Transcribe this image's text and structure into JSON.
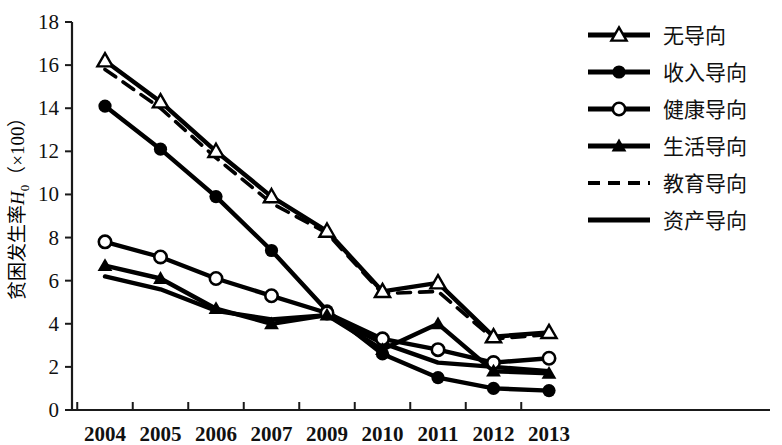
{
  "chart_data": {
    "type": "line",
    "title": "",
    "xlabel": "",
    "ylabel": "贫困发生率H0（×100）",
    "ylabel_parts": {
      "prefix": "贫困发生率",
      "italic": "H",
      "subscript": "0",
      "suffix": "（×100）"
    },
    "categories": [
      "2004",
      "2005",
      "2006",
      "2007",
      "2009",
      "2010",
      "2011",
      "2012",
      "2013"
    ],
    "x": [
      2004,
      2005,
      2006,
      2007,
      2009,
      2010,
      2011,
      2012,
      2013
    ],
    "ylim": [
      0,
      18
    ],
    "yticks": [
      0,
      2,
      4,
      6,
      8,
      10,
      12,
      14,
      16,
      18
    ],
    "grid": false,
    "legend_position": "top-right",
    "series": [
      {
        "name": "无导向",
        "marker": "triangle-open",
        "line": "solid",
        "color": "#000000",
        "values": [
          16.2,
          14.3,
          12.0,
          9.9,
          8.3,
          5.5,
          5.9,
          3.4,
          3.6
        ]
      },
      {
        "name": "收入导向",
        "marker": "circle-filled",
        "line": "solid",
        "color": "#000000",
        "values": [
          14.1,
          12.1,
          9.9,
          7.4,
          4.6,
          2.6,
          1.5,
          1.0,
          0.9
        ]
      },
      {
        "name": "健康导向",
        "marker": "circle-open",
        "line": "solid",
        "color": "#000000",
        "values": [
          7.8,
          7.1,
          6.1,
          5.3,
          4.5,
          3.3,
          2.8,
          2.2,
          2.4
        ]
      },
      {
        "name": "生活导向",
        "marker": "triangle-filled",
        "line": "solid",
        "color": "#000000",
        "values": [
          6.7,
          6.1,
          4.7,
          4.0,
          4.4,
          2.8,
          4.0,
          1.8,
          1.7
        ]
      },
      {
        "name": "教育导向",
        "marker": "none",
        "line": "dashed",
        "color": "#000000",
        "values": [
          15.8,
          14.0,
          11.7,
          9.6,
          8.2,
          5.4,
          5.5,
          3.3,
          3.5
        ]
      },
      {
        "name": "资产导向",
        "marker": "none",
        "line": "solid",
        "color": "#000000",
        "values": [
          6.2,
          5.6,
          4.6,
          4.2,
          4.4,
          3.1,
          2.2,
          2.0,
          1.8
        ]
      }
    ]
  },
  "axis": {
    "y_tick_labels": [
      "18",
      "16",
      "14",
      "12",
      "10",
      "8",
      "6",
      "4",
      "2",
      "0"
    ],
    "x_tick_labels": [
      "2004",
      "2005",
      "2006",
      "2007",
      "2009",
      "2010",
      "2011",
      "2012",
      "2013"
    ]
  },
  "legend": {
    "items": [
      {
        "label": "无导向",
        "marker": "triangle-open",
        "line": "solid"
      },
      {
        "label": "收入导向",
        "marker": "circle-filled",
        "line": "solid"
      },
      {
        "label": "健康导向",
        "marker": "circle-open",
        "line": "solid"
      },
      {
        "label": "生活导向",
        "marker": "triangle-filled",
        "line": "solid"
      },
      {
        "label": "教育导向",
        "marker": "none",
        "line": "dashed"
      },
      {
        "label": "资产导向",
        "marker": "none",
        "line": "solid"
      }
    ]
  }
}
